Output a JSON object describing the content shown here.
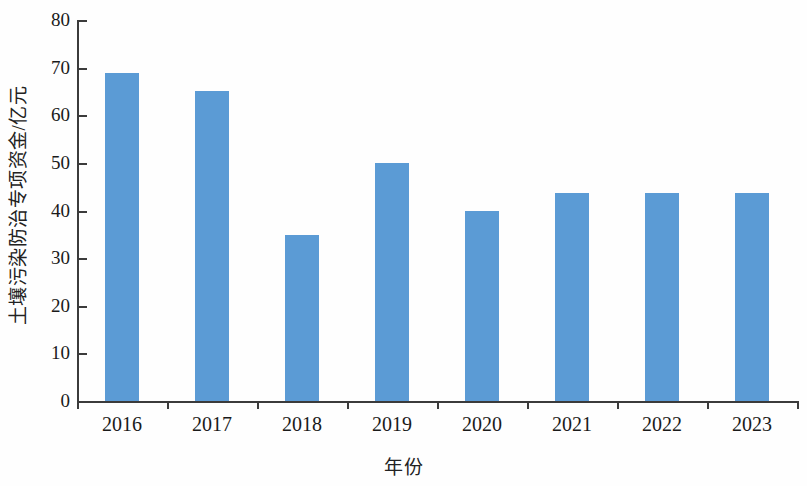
{
  "chart_data": {
    "type": "bar",
    "title": "",
    "subtitle": "",
    "xlabel": "年份",
    "ylabel": "土壤污染防治专项资金/亿元",
    "categories": [
      "2016",
      "2017",
      "2018",
      "2019",
      "2020",
      "2021",
      "2022",
      "2023"
    ],
    "values": [
      68.8,
      65.2,
      34.8,
      49.9,
      39.8,
      43.7,
      43.7,
      43.7
    ],
    "series": [
      {
        "name": "土壤污染防治专项资金",
        "values": [
          68.8,
          65.2,
          34.8,
          49.9,
          39.8,
          43.7,
          43.7,
          43.7
        ]
      }
    ],
    "ylim": [
      0,
      80
    ],
    "yticks": [
      0,
      10,
      20,
      30,
      40,
      50,
      60,
      70,
      80
    ],
    "ytick_labels": [
      "0",
      "10",
      "20",
      "30",
      "40",
      "50",
      "60",
      "70",
      "80"
    ],
    "grid": false,
    "legend": false,
    "legend_position": "none",
    "bar_color": "#5b9bd5",
    "axis_color": "#3b3b3b",
    "annotations": []
  }
}
